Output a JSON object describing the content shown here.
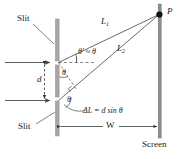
{
  "figure": {
    "colors": {
      "barrier": "#a6a6a6",
      "screen": "#8f8f8f",
      "line": "#4a4a4a",
      "text": "#1b1b1b",
      "point": "#111111",
      "background": "#ffffff"
    },
    "labels": {
      "slit_top": "Slit",
      "slit_bottom": "Slit",
      "separation": "d",
      "path_top": "L",
      "path_top_sub": "1",
      "path_bottom": "L",
      "path_bottom_sub": "2",
      "angle_prime": "θ′ ≈ θ",
      "angle_upper": "θ",
      "angle_lower": "θ",
      "point_p": "P",
      "path_difference": "ΔL = d sin θ",
      "width": "W",
      "screen": "Screen"
    }
  }
}
